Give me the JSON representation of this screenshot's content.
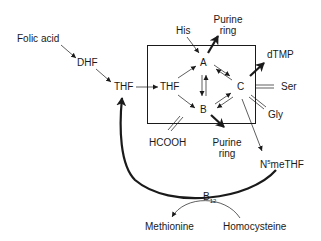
{
  "diagram": {
    "nodes": {
      "folic_acid": "Folic acid",
      "dhf": "DHF",
      "thf_outer": "THF",
      "thf_inner": "THF",
      "a": "A",
      "b": "B",
      "c": "C",
      "his": "His",
      "purine_ring_top_line1": "Purine",
      "purine_ring_top_line2": "ring",
      "dtmp": "dTMP",
      "ser": "Ser",
      "gly": "Gly",
      "hcooh": "HCOOH",
      "purine_ring_bottom_line1": "Purine",
      "purine_ring_bottom_line2": "ring",
      "n5methf_prefix": "N",
      "n5methf_sup": "5",
      "n5methf_suffix": "meTHF",
      "b12_base": "B",
      "b12_sub": "12",
      "methionine": "Methionine",
      "homocysteine": "Homocysteine"
    },
    "edges": [
      {
        "from": "Folic acid",
        "to": "DHF",
        "type": "arrow"
      },
      {
        "from": "DHF",
        "to": "THF",
        "type": "arrow"
      },
      {
        "from": "THF",
        "to": "THF (pool)",
        "type": "arrow"
      },
      {
        "from": "THF (pool)",
        "to": "A",
        "type": "arrow"
      },
      {
        "from": "THF (pool)",
        "to": "B",
        "type": "arrow"
      },
      {
        "from": "His",
        "to": "A",
        "type": "arrow"
      },
      {
        "from": "A",
        "to": "Purine ring",
        "type": "bold-arrow"
      },
      {
        "from": "A",
        "to": "B",
        "type": "reversible"
      },
      {
        "from": "A",
        "to": "C",
        "type": "reversible"
      },
      {
        "from": "B",
        "to": "C",
        "type": "reversible"
      },
      {
        "from": "C",
        "to": "dTMP",
        "type": "bold-arrow"
      },
      {
        "from": "C",
        "to": "Ser",
        "type": "reversible"
      },
      {
        "from": "C",
        "to": "Gly",
        "type": "reversible"
      },
      {
        "from": "B",
        "to": "HCOOH",
        "type": "reversible"
      },
      {
        "from": "B",
        "to": "Purine ring",
        "type": "bold-arrow"
      },
      {
        "from": "C",
        "to": "N5meTHF",
        "type": "arrow"
      },
      {
        "from": "N5meTHF",
        "to": "THF",
        "type": "bold-curved-arrow",
        "via": "B12"
      },
      {
        "from": "Homocysteine",
        "to": "Methionine",
        "type": "curved-arrow"
      }
    ],
    "colors": {
      "ink": "#1a1a1a",
      "background": "#ffffff"
    }
  }
}
